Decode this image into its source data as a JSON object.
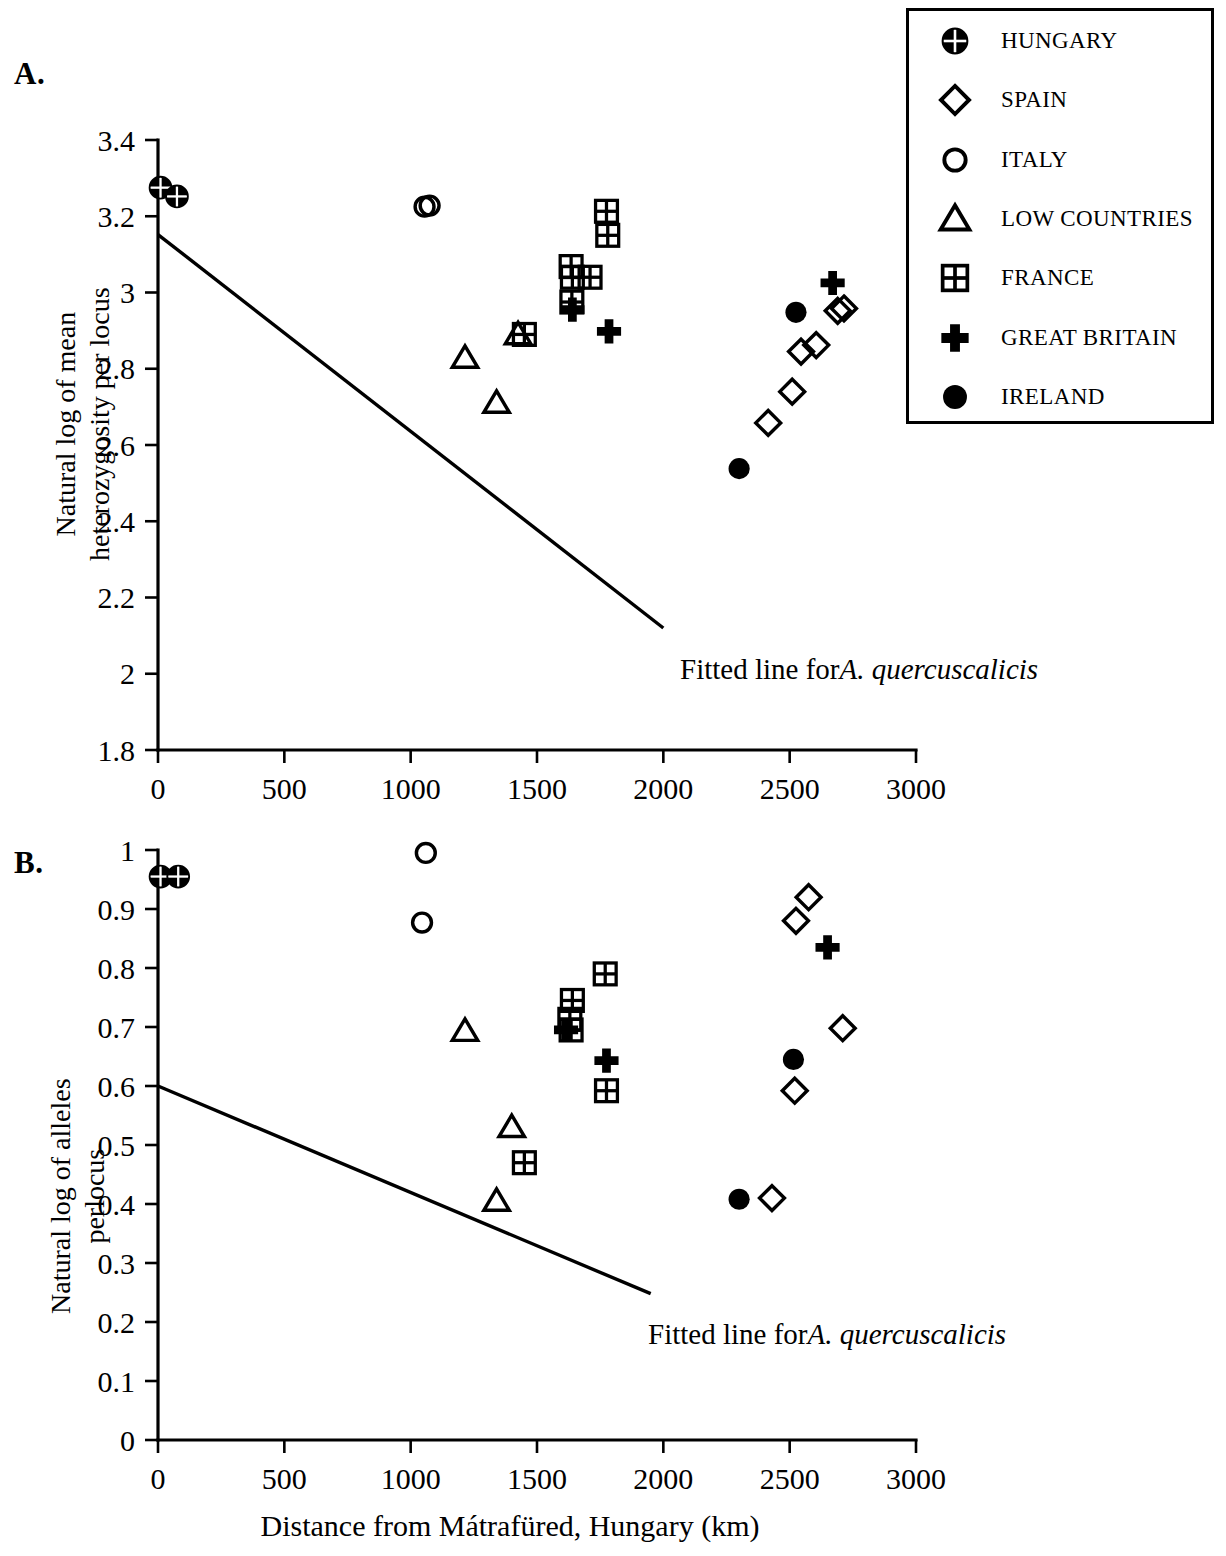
{
  "figure": {
    "panel_a_letter": "A.",
    "panel_b_letter": "B.",
    "xlabel": "Distance from Mátrafüred, Hungary (km)",
    "fit_label_prefix": "Fitted line for",
    "fit_label_species": "A. quercuscalicis"
  },
  "legend": {
    "position": "top-right",
    "entries": [
      {
        "label": "HUNGARY",
        "marker": "circle-crossed-filled",
        "key": "hungary"
      },
      {
        "label": "SPAIN",
        "marker": "diamond-open",
        "key": "spain"
      },
      {
        "label": "ITALY",
        "marker": "circle-open",
        "key": "italy"
      },
      {
        "label": "LOW COUNTRIES",
        "marker": "triangle-open",
        "key": "low_countries"
      },
      {
        "label": "FRANCE",
        "marker": "square-gridded",
        "key": "france"
      },
      {
        "label": "GREAT BRITAIN",
        "marker": "cross-filled",
        "key": "great_britain"
      },
      {
        "label": "IRELAND",
        "marker": "circle-filled",
        "key": "ireland"
      }
    ]
  },
  "chart_data": [
    {
      "panel": "A",
      "type": "scatter",
      "title": "",
      "xlabel": "Distance from Mátrafüred, Hungary (km)",
      "ylabel": "Natural log of mean heterozygosity per locus",
      "ylabel_lines": [
        "Natural log of mean",
        "heterozygosity per locus"
      ],
      "xlim": [
        0,
        3000
      ],
      "ylim": [
        1.8,
        3.4
      ],
      "xticks": [
        0,
        500,
        1000,
        1500,
        2000,
        2500,
        3000
      ],
      "yticks": [
        1.8,
        2,
        2.2,
        2.4,
        2.6,
        2.8,
        3,
        3.2,
        3.4
      ],
      "xticklabels": [
        "0",
        "500",
        "1000",
        "1500",
        "2000",
        "2500",
        "3000"
      ],
      "yticklabels": [
        "1.8",
        "2",
        "2.2",
        "2.4",
        "2.6",
        "2.8",
        "3",
        "3.2",
        "3.4"
      ],
      "grid": false,
      "series": [
        {
          "name": "HUNGARY",
          "marker": "circle-crossed-filled",
          "points": [
            [
              10,
              3.275
            ],
            [
              75,
              3.252
            ]
          ]
        },
        {
          "name": "ITALY",
          "marker": "circle-open",
          "points": [
            [
              1055,
              3.225
            ],
            [
              1075,
              3.228
            ]
          ]
        },
        {
          "name": "LOW COUNTRIES",
          "marker": "triangle-open",
          "points": [
            [
              1215,
              2.828
            ],
            [
              1340,
              2.71
            ],
            [
              1425,
              2.89
            ]
          ]
        },
        {
          "name": "FRANCE",
          "marker": "square-gridded",
          "points": [
            [
              1450,
              2.89
            ],
            [
              1635,
              3.068
            ],
            [
              1640,
              3.04
            ],
            [
              1638,
              2.975
            ],
            [
              1710,
              3.04
            ],
            [
              1775,
              3.213
            ],
            [
              1780,
              3.15
            ]
          ]
        },
        {
          "name": "GREAT BRITAIN",
          "marker": "cross-filled",
          "points": [
            [
              1640,
              2.955
            ],
            [
              1785,
              2.898
            ],
            [
              2670,
              3.025
            ]
          ]
        },
        {
          "name": "SPAIN",
          "marker": "diamond-open",
          "points": [
            [
              2415,
              2.658
            ],
            [
              2510,
              2.74
            ],
            [
              2545,
              2.845
            ],
            [
              2605,
              2.862
            ],
            [
              2690,
              2.952
            ],
            [
              2715,
              2.958
            ]
          ]
        },
        {
          "name": "IRELAND",
          "marker": "circle-filled",
          "points": [
            [
              2300,
              2.538
            ],
            [
              2525,
              2.948
            ]
          ]
        }
      ],
      "fitted_line": {
        "label": "Fitted line for A. quercuscalicis",
        "x": [
          0,
          2000
        ],
        "y": [
          3.152,
          2.12
        ]
      }
    },
    {
      "panel": "B",
      "type": "scatter",
      "title": "",
      "xlabel": "Distance from Mátrafüred, Hungary (km)",
      "ylabel": "Natural log of alleles perlocus",
      "ylabel_lines": [
        "Natural log of alleles",
        "perlocus"
      ],
      "xlim": [
        0,
        3000
      ],
      "ylim": [
        0,
        1
      ],
      "xticks": [
        0,
        500,
        1000,
        1500,
        2000,
        2500,
        3000
      ],
      "yticks": [
        0,
        0.1,
        0.2,
        0.3,
        0.4,
        0.5,
        0.6,
        0.7,
        0.8,
        0.9,
        1
      ],
      "xticklabels": [
        "0",
        "500",
        "1000",
        "1500",
        "2000",
        "2500",
        "3000"
      ],
      "yticklabels": [
        "0",
        "0.1",
        "0.2",
        "0.3",
        "0.4",
        "0.5",
        "0.6",
        "0.7",
        "0.8",
        "0.9",
        "1"
      ],
      "grid": false,
      "series": [
        {
          "name": "HUNGARY",
          "marker": "circle-crossed-filled",
          "points": [
            [
              10,
              0.955
            ],
            [
              80,
              0.955
            ]
          ]
        },
        {
          "name": "ITALY",
          "marker": "circle-open",
          "points": [
            [
              1060,
              0.995
            ],
            [
              1045,
              0.877
            ]
          ]
        },
        {
          "name": "LOW COUNTRIES",
          "marker": "triangle-open",
          "points": [
            [
              1215,
              0.693
            ],
            [
              1400,
              0.53
            ],
            [
              1340,
              0.405
            ]
          ]
        },
        {
          "name": "FRANCE",
          "marker": "square-gridded",
          "points": [
            [
              1640,
              0.745
            ],
            [
              1630,
              0.713
            ],
            [
              1635,
              0.695
            ],
            [
              1770,
              0.79
            ],
            [
              1775,
              0.592
            ],
            [
              1450,
              0.47
            ]
          ]
        },
        {
          "name": "GREAT BRITAIN",
          "marker": "cross-filled",
          "points": [
            [
              1615,
              0.695
            ],
            [
              1775,
              0.643
            ],
            [
              2650,
              0.835
            ]
          ]
        },
        {
          "name": "SPAIN",
          "marker": "diamond-open",
          "points": [
            [
              2575,
              0.92
            ],
            [
              2525,
              0.88
            ],
            [
              2710,
              0.698
            ],
            [
              2520,
              0.592
            ],
            [
              2430,
              0.41
            ]
          ]
        },
        {
          "name": "IRELAND",
          "marker": "circle-filled",
          "points": [
            [
              2515,
              0.645
            ],
            [
              2300,
              0.408
            ]
          ]
        }
      ],
      "fitted_line": {
        "label": "Fitted line for A. quercuscalicis",
        "x": [
          0,
          1950
        ],
        "y": [
          0.6,
          0.248
        ]
      }
    }
  ]
}
